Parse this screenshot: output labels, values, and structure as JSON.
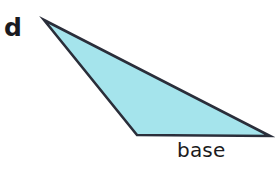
{
  "figure": {
    "kind": "geometry-diagram",
    "background_color": "#ffffff",
    "width": 278,
    "height": 170,
    "labels": {
      "part_letter": "d",
      "base_label": "base"
    },
    "shape": {
      "name": "triangle",
      "fill_color": "#a5e4ec",
      "stroke_color": "#2a2e3a",
      "stroke_width": 2.6,
      "vertices": [
        {
          "name": "apex-left",
          "x": 44,
          "y": 20
        },
        {
          "name": "bottom-right",
          "x": 270,
          "y": 136
        },
        {
          "name": "bottom-left",
          "x": 137,
          "y": 135
        }
      ],
      "points_attr": "44,20 270,136 137,135",
      "edges": [
        {
          "name": "base-edge",
          "from": "bottom-left",
          "to": "bottom-right"
        },
        {
          "name": "left-edge",
          "from": "apex-left",
          "to": "bottom-left"
        },
        {
          "name": "long-edge",
          "from": "apex-left",
          "to": "bottom-right"
        }
      ]
    }
  }
}
